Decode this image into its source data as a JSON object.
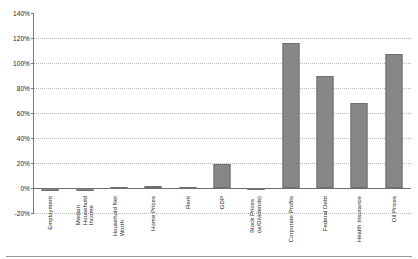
{
  "chart_data": {
    "type": "bar",
    "title": "",
    "xlabel": "",
    "ylabel": "",
    "ylim": [
      -20,
      140
    ],
    "ytick_step": 20,
    "grid": true,
    "legend": false,
    "bar_color": "#878787",
    "categories": [
      "Employment",
      "Median Household Income",
      "Household Net Worth",
      "Home Prices",
      "Rent",
      "GDP",
      "Stock Prices (w/Dividends)",
      "Corporate Profits",
      "Federal Debt",
      "Health Insurance",
      "Oil Prices"
    ],
    "category_lines": [
      [
        "Employment"
      ],
      [
        "Median",
        "Household",
        "Income"
      ],
      [
        "Household Net",
        "Worth"
      ],
      [
        "Home Prices"
      ],
      [
        "Rent"
      ],
      [
        "GDP"
      ],
      [
        "Stock Prices",
        "(w/Dividends)"
      ],
      [
        "Corporate Profits"
      ],
      [
        "Federal Debt"
      ],
      [
        "Health Insurance"
      ],
      [
        "Oil Prices"
      ]
    ],
    "values": [
      -2,
      -2,
      1,
      2,
      1,
      19,
      -1,
      116,
      90,
      68,
      107
    ],
    "ytick_labels": [
      "140%",
      "120%",
      "100%",
      "80%",
      "60%",
      "40%",
      "20%",
      "0%",
      "-20%"
    ],
    "ytick_values": [
      140,
      120,
      100,
      80,
      60,
      40,
      20,
      0,
      -20
    ]
  }
}
